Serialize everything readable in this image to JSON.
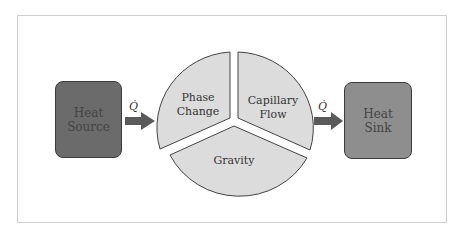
{
  "diagram": {
    "source": {
      "label": "Heat\nSource",
      "color": "#6b6b6b"
    },
    "sink": {
      "label": "Heat\nSink",
      "color": "#8e8e8e"
    },
    "arrow_in": {
      "label": "Q̇"
    },
    "arrow_out": {
      "label": "Q̇"
    },
    "segments": [
      {
        "label_line1": "Phase",
        "label_line2": "Change"
      },
      {
        "label_line1": "Capillary",
        "label_line2": "Flow"
      },
      {
        "label_line1": "Gravity",
        "label_line2": ""
      }
    ],
    "segment_fill": "#dcdcdc",
    "arrow_color": "#5a5a5a"
  }
}
